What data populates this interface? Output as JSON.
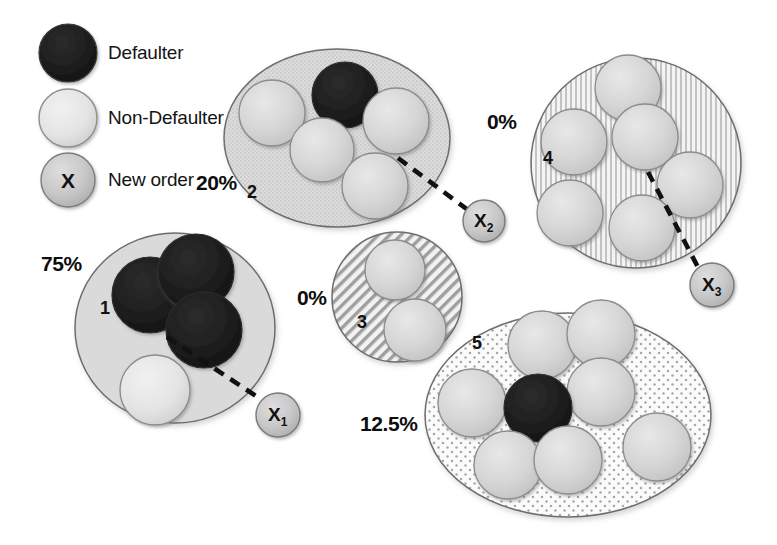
{
  "diagram": {
    "background": "#ffffff",
    "colors": {
      "defaulter": "#1c1c1c",
      "non_defaulter": "#d2d2d2",
      "new_order": "#c6c6c6",
      "outline": "#4a4a4a",
      "text": "#111111",
      "dashed_link": "#101010"
    }
  },
  "legend": {
    "items": [
      {
        "key": "defaulter",
        "label": "Defaulter",
        "swatch": "dark-circle",
        "swatch_text": ""
      },
      {
        "key": "non-defaulter",
        "label": "Non-Defaulter",
        "swatch": "light-circle",
        "swatch_text": ""
      },
      {
        "key": "new-order",
        "label": "New order",
        "swatch": "x-circle",
        "swatch_text": "X"
      }
    ]
  },
  "clusters": [
    {
      "id": "1",
      "percent": "75%",
      "fill": "solid",
      "defaulters": 3,
      "non_defaulters": 1,
      "total": 4,
      "linked_order": "X1"
    },
    {
      "id": "2",
      "percent": "20%",
      "fill": "stipple",
      "defaulters": 1,
      "non_defaulters": 4,
      "total": 5,
      "linked_order": "X2"
    },
    {
      "id": "3",
      "percent": "0%",
      "fill": "diagonal-hatch",
      "defaulters": 0,
      "non_defaulters": 2,
      "total": 2,
      "linked_order": ""
    },
    {
      "id": "4",
      "percent": "0%",
      "fill": "vertical-hatch",
      "defaulters": 0,
      "non_defaulters": 6,
      "total": 6,
      "linked_order": "X3"
    },
    {
      "id": "5",
      "percent": "12.5%",
      "fill": "dotted",
      "defaulters": 1,
      "non_defaulters": 7,
      "total": 8,
      "linked_order": ""
    }
  ],
  "new_orders": [
    {
      "id": "X1",
      "base": "X",
      "sub": "1",
      "linked_cluster": "1"
    },
    {
      "id": "X2",
      "base": "X",
      "sub": "2",
      "linked_cluster": "2"
    },
    {
      "id": "X3",
      "base": "X",
      "sub": "3",
      "linked_cluster": "4"
    }
  ]
}
